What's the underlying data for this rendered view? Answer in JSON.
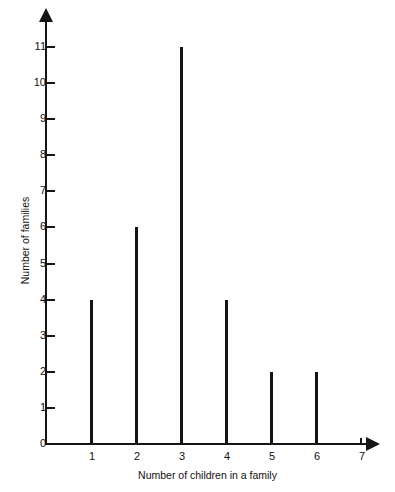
{
  "chart_data": {
    "type": "bar",
    "title": "",
    "subtitle": "",
    "xlabel": "Number of children in a family",
    "ylabel": "Number of families",
    "categories": [
      1,
      2,
      3,
      4,
      5,
      6
    ],
    "values": [
      4,
      6,
      11,
      4,
      2,
      2
    ],
    "series": [
      {
        "name": "Number of families",
        "values": [
          4,
          6,
          11,
          4,
          2,
          2
        ]
      }
    ],
    "xlim": [
      0,
      7
    ],
    "ylim": [
      0,
      11
    ],
    "x_tick_labels": [
      "1",
      "2",
      "3",
      "4",
      "5",
      "6",
      "7"
    ],
    "x_tick_values": [
      1,
      2,
      3,
      4,
      5,
      6,
      7
    ],
    "y_tick_labels": [
      "0",
      "1",
      "2",
      "3",
      "4",
      "5",
      "6",
      "7",
      "8",
      "9",
      "10",
      "11"
    ],
    "y_tick_values": [
      0,
      1,
      2,
      3,
      4,
      5,
      6,
      7,
      8,
      9,
      10,
      11
    ],
    "grid": false,
    "legend": false,
    "legend_position": "none",
    "annotations": [],
    "style": {
      "bar_color": "#151515",
      "axis_color": "#151515",
      "background": "#ffffff",
      "bar_style": "thin-vertical-line",
      "x_axis_arrow": true,
      "y_axis_arrow": true
    }
  }
}
